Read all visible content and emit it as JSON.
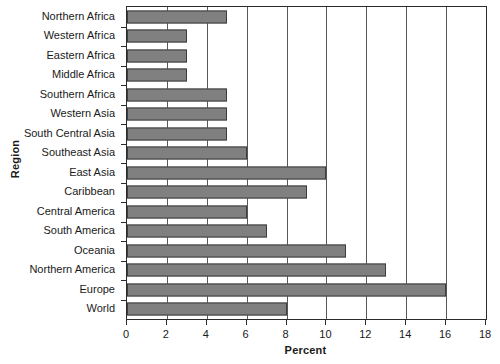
{
  "chart_data": {
    "type": "bar",
    "orientation": "horizontal",
    "title": "",
    "xlabel": "Percent",
    "ylabel": "Region",
    "xlim": [
      0,
      18
    ],
    "xticks": [
      0,
      2,
      4,
      6,
      8,
      10,
      12,
      14,
      16,
      18
    ],
    "grid": "vertical",
    "legend": "none",
    "categories": [
      "Northern Africa",
      "Western Africa",
      "Eastern Africa",
      "Middle Africa",
      "Southern Africa",
      "Western Asia",
      "South Central Asia",
      "Southeast Asia",
      "East Asia",
      "Caribbean",
      "Central America",
      "South America",
      "Oceania",
      "Northern America",
      "Europe",
      "World"
    ],
    "values": [
      5,
      3,
      3,
      3,
      5,
      5,
      5,
      6,
      10,
      9,
      6,
      7,
      11,
      13,
      16,
      8
    ],
    "colors": {
      "bar_fill": "#808080",
      "bar_stroke": "#3d3d3d",
      "grid": "#585858",
      "axis": "#2b2b2b",
      "background": "#ffffff",
      "text": "#1a1a1a"
    }
  }
}
